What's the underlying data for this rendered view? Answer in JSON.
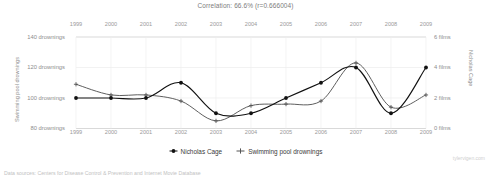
{
  "title": "Correlation: 66.6% (r=0.666004)",
  "footer": "Data sources: Centers for Disease Control & Prevention and Internet Movie Database",
  "watermark": "tylervigen.com",
  "legend": {
    "items": [
      {
        "label": "Nicholas Cage",
        "marker": "filled-diamond-marker",
        "color": "#111111"
      },
      {
        "label": "Swimming pool drownings",
        "marker": "plus-cross-marker",
        "color": "#555555"
      }
    ]
  },
  "axes": {
    "x_labels": [
      "1999",
      "2000",
      "2001",
      "2002",
      "2003",
      "2004",
      "2005",
      "2006",
      "2007",
      "2008",
      "2009"
    ],
    "left": {
      "title": "Swimming pool drownings",
      "ticks": [
        "140 drownings",
        "120 drownings",
        "100 drownings",
        "80 drownings"
      ],
      "tick_values": [
        140,
        120,
        100,
        80
      ]
    },
    "right": {
      "title": "Nicholas Cage",
      "ticks": [
        "6 films",
        "4 films",
        "2 films",
        "0 films"
      ],
      "tick_values": [
        6,
        4,
        2,
        0
      ]
    }
  },
  "chart_data": {
    "type": "line",
    "title": "Correlation: 66.6% (r=0.666004)",
    "xlabel": "",
    "ylabel": "Swimming pool drownings",
    "x": [
      1999,
      2000,
      2001,
      2002,
      2003,
      2004,
      2005,
      2006,
      2007,
      2008,
      2009
    ],
    "grid": true,
    "legend_position": "bottom",
    "series": [
      {
        "name": "Nicholas Cage",
        "unit": "films",
        "axis": "right",
        "ylim": [
          0,
          6
        ],
        "color": "#111111",
        "values": [
          2,
          2,
          2,
          3,
          1,
          1,
          2,
          3,
          4,
          1,
          4
        ]
      },
      {
        "name": "Swimming pool drownings",
        "unit": "drownings",
        "axis": "left",
        "ylim": [
          80,
          140
        ],
        "color": "#555555",
        "values": [
          109,
          102,
          102,
          98,
          85,
          95,
          96,
          98,
          123,
          94,
          102
        ]
      }
    ]
  }
}
